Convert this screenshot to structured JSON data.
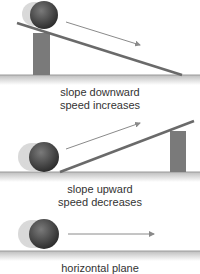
{
  "panels": [
    {
      "id": "downward",
      "caption_line1": "slope downward",
      "caption_line2": "speed increases"
    },
    {
      "id": "upward",
      "caption_line1": "slope upward",
      "caption_line2": "speed decreases"
    },
    {
      "id": "horizontal",
      "caption_line1": "horizontal plane",
      "caption_line2": ""
    }
  ],
  "colors": {
    "ball": "#4a4a4a",
    "block": "#7a7a7a",
    "ramp": "#6a6a6a",
    "arrow": "#8a8a8a",
    "ground": "#999999"
  }
}
